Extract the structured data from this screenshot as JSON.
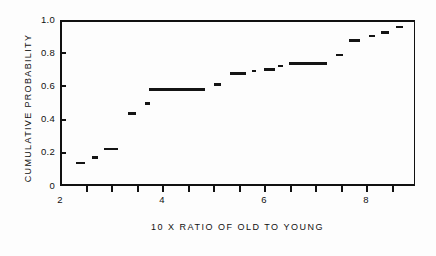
{
  "chart_data": {
    "type": "line",
    "subtype": "empirical-cdf-step",
    "title": "",
    "xlabel": "10 X   RATIO  OF  OLD  TO  YOUNG",
    "ylabel": "CUMULATIVE  PROBABILITY",
    "xlim": [
      2,
      8.96
    ],
    "ylim": [
      0,
      1.0
    ],
    "grid": false,
    "legend": null,
    "xticks": [
      2,
      2.5,
      3,
      3.5,
      4,
      4.5,
      5,
      5.5,
      6,
      6.5,
      7,
      7.5,
      8,
      8.5
    ],
    "xtick_labels": [
      "2",
      "",
      "",
      "",
      "4",
      "",
      "",
      "",
      "6",
      "",
      "",
      "",
      "8",
      ""
    ],
    "xtick_major": [
      2,
      4,
      6,
      8
    ],
    "yticks": [
      0,
      0.2,
      0.4,
      0.6,
      0.8,
      1.0
    ],
    "ytick_labels": [
      "0",
      "0.2",
      "0.4",
      "0.6",
      "0.8",
      "1.0"
    ],
    "series_name": "Empirical cumulative distribution",
    "steps": [
      {
        "x_start": 2.28,
        "x_end": 2.45,
        "y": 0.15
      },
      {
        "x_start": 2.59,
        "x_end": 2.71,
        "y": 0.185
      },
      {
        "x_start": 2.82,
        "x_end": 3.1,
        "y": 0.235
      },
      {
        "x_start": 3.29,
        "x_end": 3.45,
        "y": 0.45
      },
      {
        "x_start": 3.63,
        "x_end": 3.73,
        "y": 0.51
      },
      {
        "x_start": 3.71,
        "x_end": 4.8,
        "y": 0.595
      },
      {
        "x_start": 4.98,
        "x_end": 5.12,
        "y": 0.625
      },
      {
        "x_start": 5.29,
        "x_end": 5.61,
        "y": 0.69
      },
      {
        "x_start": 5.73,
        "x_end": 5.81,
        "y": 0.705
      },
      {
        "x_start": 5.96,
        "x_end": 6.18,
        "y": 0.715
      },
      {
        "x_start": 6.24,
        "x_end": 6.33,
        "y": 0.735
      },
      {
        "x_start": 6.45,
        "x_end": 7.2,
        "y": 0.75
      },
      {
        "x_start": 7.38,
        "x_end": 7.5,
        "y": 0.8
      },
      {
        "x_start": 7.63,
        "x_end": 7.85,
        "y": 0.89
      },
      {
        "x_start": 8.02,
        "x_end": 8.14,
        "y": 0.915
      },
      {
        "x_start": 8.25,
        "x_end": 8.42,
        "y": 0.935
      },
      {
        "x_start": 8.55,
        "x_end": 8.68,
        "y": 0.97
      }
    ],
    "values": [
      0.15,
      0.185,
      0.235,
      0.45,
      0.51,
      0.595,
      0.625,
      0.69,
      0.705,
      0.715,
      0.735,
      0.75,
      0.8,
      0.89,
      0.915,
      0.935,
      0.97
    ],
    "x": [
      2.28,
      2.59,
      2.82,
      3.29,
      3.63,
      3.71,
      4.98,
      5.29,
      5.73,
      5.96,
      6.24,
      6.45,
      7.38,
      7.63,
      8.02,
      8.25,
      8.55
    ]
  },
  "axes": {
    "y_label": "CUMULATIVE  PROBABILITY",
    "x_label": "10 X   RATIO  OF  OLD  TO  YOUNG",
    "y_tick_labels": [
      "1.0",
      "0.8",
      "0.6",
      "0.4",
      "0.2",
      "0"
    ],
    "x_tick_labels": [
      "2",
      "4",
      "6",
      "8"
    ]
  },
  "colors": {
    "data": "#141414",
    "axis": "#111111",
    "background": "#fdfdfd"
  }
}
